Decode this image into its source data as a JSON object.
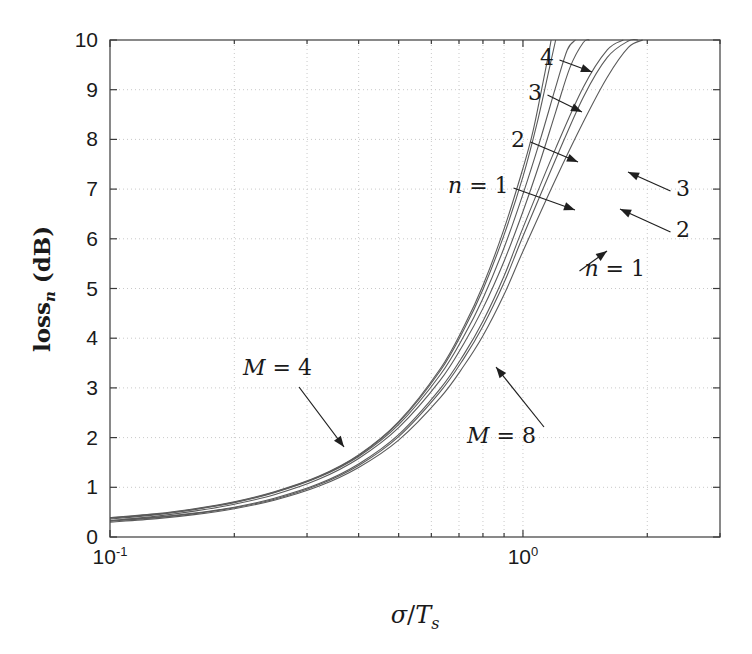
{
  "chart_data": {
    "type": "line",
    "title": "",
    "xlabel": "sigma/T_s",
    "xlabel_parts": {
      "sigma": "σ",
      "slash": "/",
      "T": "T",
      "sub": "s"
    },
    "ylabel": "loss_n (dB)",
    "ylabel_parts": {
      "main": "loss",
      "sub": "n",
      "unit": "(dB)"
    },
    "xscale": "log",
    "yscale": "linear",
    "xlim": [
      0.1,
      3.0
    ],
    "ylim": [
      0,
      10
    ],
    "grid": true,
    "grid_style": "dotted",
    "legend_position": "inline-annotations",
    "xticks": [
      {
        "value": 0.1,
        "label": "10",
        "exponent": "-1"
      },
      {
        "value": 1.0,
        "label": "10",
        "exponent": "0"
      }
    ],
    "yticks": [
      0,
      1,
      2,
      3,
      4,
      5,
      6,
      7,
      8,
      9,
      10
    ],
    "ytick_labels": [
      "0",
      "1",
      "2",
      "3",
      "4",
      "5",
      "6",
      "7",
      "8",
      "9",
      "10"
    ],
    "colors": {
      "curve": "#555555",
      "grid": "#c8c8c8",
      "axis": "#4a4a4a",
      "text": "#1a1a1a"
    },
    "series": [
      {
        "name": "M = 4, n = 1",
        "group": "M=4",
        "n": 1,
        "x": [
          0.1,
          0.13,
          0.16,
          0.2,
          0.25,
          0.32,
          0.4,
          0.5,
          0.63,
          0.72,
          0.8,
          0.9,
          1.0,
          1.1,
          1.2,
          1.3,
          1.4,
          1.45
        ],
        "y": [
          0.33,
          0.42,
          0.52,
          0.66,
          0.85,
          1.16,
          1.58,
          2.2,
          3.15,
          3.9,
          4.6,
          5.55,
          6.55,
          7.55,
          8.55,
          9.45,
          9.95,
          10.0
        ]
      },
      {
        "name": "M = 4, n = 2",
        "group": "M=4",
        "n": 2,
        "x": [
          0.1,
          0.13,
          0.16,
          0.2,
          0.25,
          0.32,
          0.4,
          0.5,
          0.63,
          0.72,
          0.8,
          0.9,
          1.0,
          1.1,
          1.2,
          1.28,
          1.34
        ],
        "y": [
          0.36,
          0.45,
          0.55,
          0.69,
          0.89,
          1.2,
          1.62,
          2.26,
          3.26,
          4.05,
          4.8,
          5.82,
          6.9,
          7.98,
          9.05,
          9.8,
          10.0
        ]
      },
      {
        "name": "M = 4, n = 3",
        "group": "M=4",
        "n": 3,
        "x": [
          0.1,
          0.13,
          0.16,
          0.2,
          0.25,
          0.32,
          0.4,
          0.5,
          0.63,
          0.72,
          0.8,
          0.9,
          1.0,
          1.08,
          1.16,
          1.2
        ],
        "y": [
          0.38,
          0.46,
          0.56,
          0.7,
          0.9,
          1.21,
          1.64,
          2.3,
          3.34,
          4.18,
          4.98,
          6.08,
          7.25,
          8.3,
          9.45,
          10.0
        ]
      },
      {
        "name": "M = 4, n = 4",
        "group": "M=4",
        "n": 4,
        "x": [
          0.1,
          0.13,
          0.16,
          0.2,
          0.25,
          0.32,
          0.4,
          0.5,
          0.63,
          0.72,
          0.8,
          0.9,
          1.0,
          1.06,
          1.14,
          1.17
        ],
        "y": [
          0.39,
          0.47,
          0.57,
          0.71,
          0.91,
          1.22,
          1.65,
          2.32,
          3.38,
          4.24,
          5.06,
          6.2,
          7.42,
          8.2,
          9.5,
          10.0
        ]
      },
      {
        "name": "M = 8, n = 1",
        "group": "M=8",
        "n": 1,
        "x": [
          0.1,
          0.13,
          0.16,
          0.2,
          0.25,
          0.32,
          0.4,
          0.5,
          0.63,
          0.72,
          0.8,
          0.9,
          1.0,
          1.2,
          1.4,
          1.6,
          1.8,
          1.95,
          2.05
        ],
        "y": [
          0.3,
          0.37,
          0.45,
          0.57,
          0.74,
          1.02,
          1.4,
          1.95,
          2.8,
          3.45,
          4.05,
          4.88,
          5.75,
          7.2,
          8.35,
          9.25,
          9.85,
          10.0,
          10.0
        ]
      },
      {
        "name": "M = 8, n = 2",
        "group": "M=8",
        "n": 2,
        "x": [
          0.1,
          0.13,
          0.16,
          0.2,
          0.25,
          0.32,
          0.4,
          0.5,
          0.63,
          0.72,
          0.8,
          0.9,
          1.0,
          1.2,
          1.4,
          1.6,
          1.8,
          1.9
        ],
        "y": [
          0.32,
          0.39,
          0.47,
          0.59,
          0.76,
          1.05,
          1.44,
          2.02,
          2.92,
          3.6,
          4.24,
          5.12,
          6.05,
          7.6,
          8.85,
          9.65,
          9.98,
          10.0
        ]
      },
      {
        "name": "M = 8, n = 3",
        "group": "M=8",
        "n": 3,
        "x": [
          0.1,
          0.13,
          0.16,
          0.2,
          0.25,
          0.32,
          0.4,
          0.5,
          0.63,
          0.72,
          0.8,
          0.9,
          1.0,
          1.2,
          1.4,
          1.6,
          1.75,
          1.82
        ],
        "y": [
          0.33,
          0.4,
          0.48,
          0.6,
          0.78,
          1.07,
          1.47,
          2.06,
          2.98,
          3.68,
          4.34,
          5.25,
          6.22,
          7.82,
          9.05,
          9.8,
          10.0,
          10.0
        ]
      }
    ],
    "annotations": [
      {
        "id": "a-m4-n4",
        "text": "4",
        "italic_prefix": "",
        "x_text": 540,
        "y_text": 65,
        "tip_x": 592,
        "tip_y": 72
      },
      {
        "id": "a-m4-n3",
        "text": "3",
        "italic_prefix": "",
        "x_text": 528,
        "y_text": 100,
        "tip_x": 582,
        "tip_y": 112
      },
      {
        "id": "a-m4-n2",
        "text": "2",
        "italic_prefix": "",
        "x_text": 511,
        "y_text": 147,
        "tip_x": 578,
        "tip_y": 162
      },
      {
        "id": "a-m4-n1",
        "text": "n = 1",
        "italic_prefix": "n",
        "x_text": 448,
        "y_text": 193,
        "tip_x": 575,
        "tip_y": 210
      },
      {
        "id": "a-m8-n3",
        "text": "3",
        "italic_prefix": "",
        "x_text": 690,
        "y_text": 196,
        "tip_x": 628,
        "tip_y": 172
      },
      {
        "id": "a-m8-n2",
        "text": "2",
        "italic_prefix": "",
        "x_text": 690,
        "y_text": 237,
        "tip_x": 620,
        "tip_y": 209
      },
      {
        "id": "a-m8-n1",
        "text": "n = 1",
        "italic_prefix": "n",
        "x_text": 645,
        "y_text": 276,
        "tip_x": 607,
        "tip_y": 251
      },
      {
        "id": "a-group-m4",
        "text": "M = 4",
        "italic_prefix": "M",
        "x_text": 243,
        "y_text": 375,
        "tip_x": 344,
        "tip_y": 447
      },
      {
        "id": "a-group-m8",
        "text": "M = 8",
        "italic_prefix": "M",
        "x_text": 536,
        "y_text": 443,
        "tip_x": 496,
        "tip_y": 367
      }
    ]
  },
  "axes_box": {
    "left": 110,
    "top": 40,
    "right": 720,
    "bottom": 537
  }
}
